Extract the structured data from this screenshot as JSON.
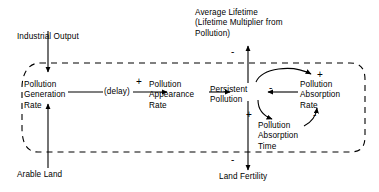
{
  "diagram": {
    "type": "causal-loop",
    "colors": {
      "background": "#ffffff",
      "stroke": "#000000",
      "text": "#000000"
    },
    "nodes": [
      {
        "id": "industrial-output",
        "label": "Industrial Output"
      },
      {
        "id": "arable-land",
        "label": "Arable Land"
      },
      {
        "id": "pollution-generation-rate",
        "label": "Pollution\nGeneration\nRate"
      },
      {
        "id": "delay",
        "label": "(delay)"
      },
      {
        "id": "pollution-appearance-rate",
        "label": "Pollution\nAppearance\nRate"
      },
      {
        "id": "persistent-pollution",
        "label": "Persistent\nPollution"
      },
      {
        "id": "pollution-absorption-rate",
        "label": "Pollution\nAbsorption\nRate"
      },
      {
        "id": "pollution-absorption-time",
        "label": "Pollution\nAbsorption\nTime"
      },
      {
        "id": "average-lifetime",
        "label": "Average Lifetime\n(Lifetime Multiplier from\nPollution)"
      },
      {
        "id": "land-fertility",
        "label": "Land Fertility"
      }
    ],
    "links": [
      {
        "from": "industrial-output",
        "to": "pollution-generation-rate",
        "sign": ""
      },
      {
        "from": "arable-land",
        "to": "pollution-generation-rate",
        "sign": ""
      },
      {
        "from": "pollution-generation-rate",
        "to": "pollution-appearance-rate",
        "sign": "+",
        "via": "delay"
      },
      {
        "from": "pollution-appearance-rate",
        "to": "persistent-pollution",
        "sign": ""
      },
      {
        "from": "pollution-absorption-rate",
        "to": "persistent-pollution",
        "sign": "-"
      },
      {
        "from": "persistent-pollution",
        "to": "pollution-absorption-rate",
        "sign": "+"
      },
      {
        "from": "persistent-pollution",
        "to": "pollution-absorption-time",
        "sign": "+"
      },
      {
        "from": "pollution-absorption-time",
        "to": "pollution-absorption-rate",
        "sign": "-"
      },
      {
        "from": "persistent-pollution",
        "to": "average-lifetime",
        "sign": "-"
      },
      {
        "from": "persistent-pollution",
        "to": "land-fertility",
        "sign": "-"
      }
    ],
    "signs": {
      "appearance_plus": "+",
      "absorption_rate_plus": "+",
      "absorption_to_pollution_minus": "-",
      "absorption_time_plus": "+",
      "time_to_rate_minus": "-",
      "lifetime_minus": "-",
      "fertility_minus": "-"
    },
    "loop_boundary": {
      "style": "dashed",
      "description": "dashed feedback loop enclosing the pollution sector"
    }
  }
}
